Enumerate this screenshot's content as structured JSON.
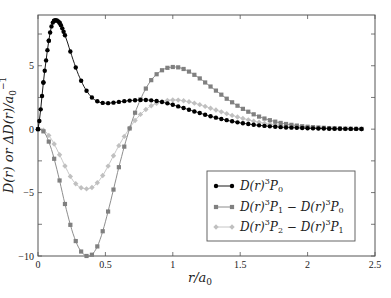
{
  "chart_data": {
    "type": "line",
    "title": "",
    "xlabel": "r/a0",
    "ylabel": "D(r) or ΔD(r)/a0^-1",
    "xlim": [
      0,
      2.5
    ],
    "ylim": [
      -10,
      9
    ],
    "grid": false,
    "legend_position": "lower right",
    "x_ticks": [
      0,
      0.5,
      1,
      1.5,
      2,
      2.5
    ],
    "x_tick_labels": [
      "0",
      "0.5",
      "1",
      "1.5",
      "2",
      "2.5"
    ],
    "y_ticks": [
      -10,
      -5,
      0,
      5
    ],
    "y_tick_labels": [
      "−10",
      "−5",
      "0",
      "5"
    ],
    "y_minor_ticks": [
      -7.5,
      -2.5,
      2.5,
      7.5
    ],
    "x": [
      0,
      0.05,
      0.1,
      0.15,
      0.2,
      0.25,
      0.3,
      0.35,
      0.4,
      0.45,
      0.5,
      0.55,
      0.6,
      0.65,
      0.7,
      0.75,
      0.8,
      0.85,
      0.9,
      0.95,
      1.0,
      1.05,
      1.1,
      1.15,
      1.2,
      1.25,
      1.3,
      1.35,
      1.4,
      1.45,
      1.5,
      1.55,
      1.6,
      1.65,
      1.7,
      1.75,
      1.8,
      1.85,
      1.9,
      1.95,
      2.0,
      2.05,
      2.1,
      2.15,
      2.2,
      2.25,
      2.3,
      2.35,
      2.4
    ],
    "series": [
      {
        "name": "D(r) 3P0",
        "legend_main": "D(r)",
        "legend_sup": "3",
        "legend_sub": "P0",
        "color": "#000000",
        "marker": "circle",
        "values": [
          0,
          4.6,
          8.1,
          8.5,
          7.4,
          5.8,
          4.3,
          3.2,
          2.5,
          2.15,
          2.05,
          2.08,
          2.15,
          2.22,
          2.27,
          2.3,
          2.3,
          2.26,
          2.18,
          2.06,
          1.92,
          1.76,
          1.6,
          1.43,
          1.27,
          1.11,
          0.96,
          0.83,
          0.71,
          0.6,
          0.5,
          0.42,
          0.35,
          0.29,
          0.24,
          0.2,
          0.16,
          0.13,
          0.11,
          0.09,
          0.07,
          0.06,
          0.05,
          0.04,
          0.03,
          0.03,
          0.02,
          0.02,
          0.01
        ]
      },
      {
        "name": "D(r) 3P1 − D(r) 3P0",
        "legend_main": "D(r)",
        "legend_sup": "3",
        "legend_sub": "P1 − D(r)",
        "legend_sup2": "3",
        "legend_sub2": "P0",
        "color": "#808080",
        "marker": "square",
        "values": [
          0,
          -0.3,
          -1.6,
          -3.6,
          -5.9,
          -7.9,
          -9.3,
          -9.95,
          -9.9,
          -9.0,
          -7.3,
          -5.2,
          -3.0,
          -1.0,
          0.7,
          2.1,
          3.2,
          4.0,
          4.5,
          4.8,
          4.9,
          4.85,
          4.65,
          4.35,
          4.0,
          3.6,
          3.2,
          2.8,
          2.4,
          2.05,
          1.72,
          1.43,
          1.17,
          0.95,
          0.77,
          0.62,
          0.49,
          0.39,
          0.31,
          0.24,
          0.19,
          0.15,
          0.12,
          0.09,
          0.07,
          0.05,
          0.04,
          0.03,
          0.02
        ]
      },
      {
        "name": "D(r) 3P2 − D(r) 3P1",
        "legend_main": "D(r)",
        "legend_sup": "3",
        "legend_sub": "P2 − D(r)",
        "legend_sup2": "3",
        "legend_sub2": "P1",
        "color": "#c0c0c0",
        "marker": "diamond",
        "values": [
          0,
          -0.15,
          -0.8,
          -1.8,
          -2.9,
          -3.9,
          -4.5,
          -4.7,
          -4.6,
          -4.1,
          -3.3,
          -2.3,
          -1.3,
          -0.4,
          0.4,
          1.05,
          1.55,
          1.9,
          2.12,
          2.25,
          2.3,
          2.28,
          2.2,
          2.08,
          1.93,
          1.76,
          1.58,
          1.4,
          1.22,
          1.05,
          0.9,
          0.76,
          0.63,
          0.52,
          0.42,
          0.34,
          0.27,
          0.22,
          0.17,
          0.13,
          0.1,
          0.08,
          0.06,
          0.05,
          0.04,
          0.03,
          0.02,
          0.02,
          0.01
        ]
      }
    ]
  },
  "legend": {
    "items": [
      {
        "main": "D(r)",
        "sup": "3",
        "sub": "P",
        "subidx": "0",
        "rest": ""
      },
      {
        "main": "D(r)",
        "sup": "3",
        "sub": "P",
        "subidx": "1",
        "rest": " − D(r)",
        "sup2": "3",
        "sub2": "P",
        "subidx2": "0"
      },
      {
        "main": "D(r)",
        "sup": "3",
        "sub": "P",
        "subidx": "2",
        "rest": " − D(r)",
        "sup2": "3",
        "sub2": "P",
        "subidx2": "1"
      }
    ]
  },
  "axes": {
    "xlabel_main": "r/a",
    "xlabel_sub": "0",
    "ylabel_main": "D(r) or ΔD(r)/a",
    "ylabel_sub": "0",
    "ylabel_sup": "−1"
  }
}
